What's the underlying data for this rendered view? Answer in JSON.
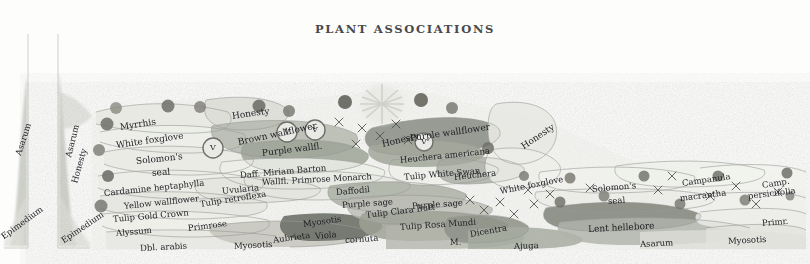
{
  "page": {
    "title": "PLANT ASSOCIATIONS",
    "medium": "watercolour-pencil garden planting plan",
    "background_color": "#fdfdfc",
    "ink_color": "#1d1d22"
  },
  "palette": {
    "ink": "#1d1d22",
    "pencil_line": "#9a9a97",
    "wash_grey_green": "#b9bdb2",
    "wash_sage": "#a8ada0",
    "wash_dark_olive": "#6f736a",
    "wash_pale": "#e4e5e0",
    "wash_warm_grey": "#c8c7be",
    "blob_dark": "#6a6a64",
    "blob_mid": "#8d8d85",
    "panel_border": "#c9c9c4"
  },
  "panels": [
    {
      "name": "left-margin-panel-1",
      "x": 4,
      "y": 34,
      "w": 26,
      "h": 214
    },
    {
      "name": "left-margin-panel-2",
      "x": 58,
      "y": 34,
      "w": 32,
      "h": 214
    }
  ],
  "margin_labels": [
    {
      "text": "Asarum",
      "x": 18,
      "y": 150,
      "rot": -72,
      "size": 8.5
    },
    {
      "text": "Epimedium",
      "x": 2,
      "y": 232,
      "rot": -36,
      "size": 8.5
    },
    {
      "text": "Asarum",
      "x": 68,
      "y": 152,
      "rot": -76,
      "size": 8.5
    },
    {
      "text": "Honesty",
      "x": 74,
      "y": 178,
      "rot": -74,
      "size": 8.5
    },
    {
      "text": "Epimedium",
      "x": 62,
      "y": 236,
      "rot": -34,
      "size": 8.5
    }
  ],
  "plant_labels": [
    {
      "text": "Myrrhis",
      "x": 120,
      "y": 122,
      "rot": -9,
      "size": 9
    },
    {
      "text": "White foxglove",
      "x": 116,
      "y": 140,
      "rot": -8,
      "size": 9
    },
    {
      "text": "Solomon's",
      "x": 136,
      "y": 156,
      "rot": -6,
      "size": 9
    },
    {
      "text": "seal",
      "x": 152,
      "y": 168,
      "rot": -5,
      "size": 9
    },
    {
      "text": "Cardamine heptaphylla",
      "x": 104,
      "y": 188,
      "rot": -6,
      "size": 8.5
    },
    {
      "text": "Yellow wallflower",
      "x": 124,
      "y": 201,
      "rot": -6,
      "size": 8.5
    },
    {
      "text": "Tulip Gold Crown",
      "x": 113,
      "y": 214,
      "rot": -5,
      "size": 8.5
    },
    {
      "text": "Alyssum",
      "x": 116,
      "y": 228,
      "rot": -5,
      "size": 8.5
    },
    {
      "text": "Dbl. arabis",
      "x": 140,
      "y": 243,
      "rot": -3,
      "size": 8.5
    },
    {
      "text": "Primrose",
      "x": 188,
      "y": 223,
      "rot": -7,
      "size": 8.5
    },
    {
      "text": "Tulip retroflexa",
      "x": 200,
      "y": 199,
      "rot": -9,
      "size": 8.5
    },
    {
      "text": "Uvularia",
      "x": 222,
      "y": 186,
      "rot": -6,
      "size": 8.5
    },
    {
      "text": "Myosotis",
      "x": 234,
      "y": 241,
      "rot": -3,
      "size": 8.5
    },
    {
      "text": "Aubrieta",
      "x": 273,
      "y": 235,
      "rot": -8,
      "size": 8.5
    },
    {
      "text": "Viola",
      "x": 315,
      "y": 231,
      "rot": -5,
      "size": 8.5
    },
    {
      "text": "cornuta",
      "x": 345,
      "y": 235,
      "rot": -4,
      "size": 8.5
    },
    {
      "text": "Myosotis",
      "x": 303,
      "y": 219,
      "rot": -8,
      "size": 8.5
    },
    {
      "text": "Honesty",
      "x": 232,
      "y": 111,
      "rot": -8,
      "size": 9
    },
    {
      "text": "Brown wallflower",
      "x": 238,
      "y": 137,
      "rot": -12,
      "size": 9
    },
    {
      "text": "Purple wallfl.",
      "x": 262,
      "y": 148,
      "rot": -7,
      "size": 9
    },
    {
      "text": "Daff. Miriam Barton",
      "x": 240,
      "y": 170,
      "rot": -5,
      "size": 8.5
    },
    {
      "text": "Wallfl. Primrose Monarch",
      "x": 262,
      "y": 177,
      "rot": -3,
      "size": 8.5
    },
    {
      "text": "Daffodil",
      "x": 336,
      "y": 187,
      "rot": -5,
      "size": 8.5
    },
    {
      "text": "Purple sage",
      "x": 342,
      "y": 200,
      "rot": -4,
      "size": 8.5
    },
    {
      "text": "Tulip Clara Butt",
      "x": 366,
      "y": 210,
      "rot": -7,
      "size": 8.5
    },
    {
      "text": "Tulip White Swan",
      "x": 404,
      "y": 172,
      "rot": -5,
      "size": 8.5
    },
    {
      "text": "Heuchera",
      "x": 454,
      "y": 172,
      "rot": -6,
      "size": 8.5
    },
    {
      "text": "Purple sage",
      "x": 412,
      "y": 201,
      "rot": -4,
      "size": 8.5
    },
    {
      "text": "Tulip Rosa Mundi",
      "x": 400,
      "y": 222,
      "rot": -4,
      "size": 8.5
    },
    {
      "text": "M.",
      "x": 450,
      "y": 237,
      "rot": -2,
      "size": 8.5
    },
    {
      "text": "Dicentra",
      "x": 470,
      "y": 229,
      "rot": -10,
      "size": 8.5
    },
    {
      "text": "Ajuga",
      "x": 514,
      "y": 241,
      "rot": -2,
      "size": 8.5
    },
    {
      "text": "Honesty",
      "x": 382,
      "y": 139,
      "rot": -13,
      "size": 9
    },
    {
      "text": "Purple wallflower",
      "x": 410,
      "y": 133,
      "rot": -8,
      "size": 9
    },
    {
      "text": "Heuchera americana",
      "x": 400,
      "y": 155,
      "rot": -6,
      "size": 8.5
    },
    {
      "text": "Honesty",
      "x": 522,
      "y": 142,
      "rot": -34,
      "size": 9
    },
    {
      "text": "White foxglove",
      "x": 500,
      "y": 186,
      "rot": -11,
      "size": 8.5
    },
    {
      "text": "Solomon's",
      "x": 592,
      "y": 184,
      "rot": -5,
      "size": 8.5
    },
    {
      "text": "seal",
      "x": 608,
      "y": 196,
      "rot": -4,
      "size": 8.5
    },
    {
      "text": "Campanula",
      "x": 682,
      "y": 178,
      "rot": -8,
      "size": 8.5
    },
    {
      "text": "macrantha",
      "x": 680,
      "y": 193,
      "rot": -7,
      "size": 8.5
    },
    {
      "text": "Camp.",
      "x": 762,
      "y": 180,
      "rot": -9,
      "size": 8.5
    },
    {
      "text": "persicifolia",
      "x": 748,
      "y": 191,
      "rot": -7,
      "size": 8.5
    },
    {
      "text": "Lent hellebore",
      "x": 588,
      "y": 224,
      "rot": -3,
      "size": 9
    },
    {
      "text": "Asarum",
      "x": 640,
      "y": 239,
      "rot": -3,
      "size": 8.5
    },
    {
      "text": "Primr.",
      "x": 762,
      "y": 218,
      "rot": -5,
      "size": 8.5
    },
    {
      "text": "Myosotis",
      "x": 728,
      "y": 236,
      "rot": -3,
      "size": 8.5
    }
  ],
  "viola_markers": [
    {
      "label": "V",
      "x": 213,
      "y": 148,
      "r": 10
    },
    {
      "label": "V",
      "x": 287,
      "y": 132,
      "r": 10
    },
    {
      "label": "V",
      "x": 315,
      "y": 130,
      "r": 10
    },
    {
      "label": "V",
      "x": 424,
      "y": 142,
      "r": 9
    }
  ],
  "drifts": [
    {
      "name": "drift-honesty-left",
      "tone": "wash_pale"
    },
    {
      "name": "drift-brown-wallflower",
      "tone": "wash_sage"
    },
    {
      "name": "drift-purple-wallflower",
      "tone": "wash_grey_green"
    },
    {
      "name": "drift-viola-cornuta",
      "tone": "wash_dark_olive"
    },
    {
      "name": "drift-tulip-clara-butt",
      "tone": "wash_warm_grey"
    },
    {
      "name": "drift-heuchera-americana",
      "tone": "wash_sage"
    },
    {
      "name": "drift-ajuga",
      "tone": "wash_warm_grey"
    },
    {
      "name": "drift-lent-hellebore",
      "tone": "wash_dark_olive"
    }
  ],
  "starburst": {
    "name": "flower-starburst",
    "x": 382,
    "y": 104,
    "r": 26
  }
}
